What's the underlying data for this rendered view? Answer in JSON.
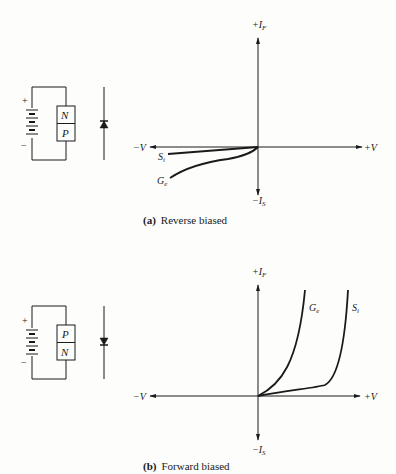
{
  "panels": [
    {
      "id": "a",
      "caption_tag": "(a)",
      "caption_text": "Reverse biased",
      "battery": {
        "plus": "+",
        "minus": "−"
      },
      "junction": {
        "top": "N",
        "bottom": "P"
      },
      "diode_direction": "up",
      "axes": {
        "x_neg": "−V",
        "x_pos": "+V",
        "y_pos_main": "+I",
        "y_pos_sub": "F",
        "y_neg_main": "−I",
        "y_neg_sub": "S"
      },
      "curves": [
        {
          "main": "S",
          "sub": "i"
        },
        {
          "main": "G",
          "sub": "e"
        }
      ]
    },
    {
      "id": "b",
      "caption_tag": "(b)",
      "caption_text": "Forward biased",
      "battery": {
        "plus": "+",
        "minus": "−"
      },
      "junction": {
        "top": "P",
        "bottom": "N"
      },
      "diode_direction": "down",
      "axes": {
        "x_neg": "−V",
        "x_pos": "+V",
        "y_pos_main": "+I",
        "y_pos_sub": "F",
        "y_neg_main": "−I",
        "y_neg_sub": "S"
      },
      "curves": [
        {
          "main": "G",
          "sub": "e"
        },
        {
          "main": "S",
          "sub": "i"
        }
      ]
    }
  ],
  "colors": {
    "ink": "#1a1a1a",
    "paper": "#fdfdfc"
  }
}
